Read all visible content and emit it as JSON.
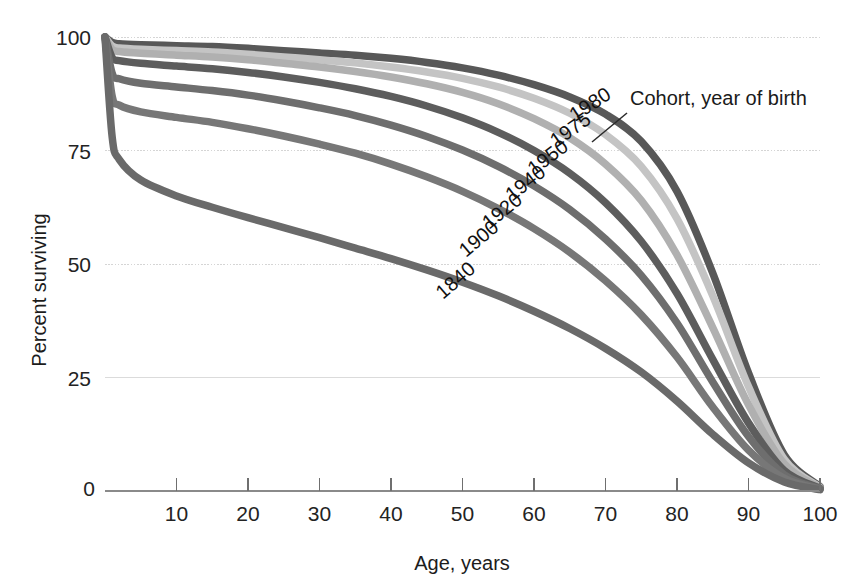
{
  "figure": {
    "background_color": "#ffffff",
    "plot_area": {
      "left": 105,
      "right": 820,
      "top": 37,
      "bottom": 491
    }
  },
  "axes": {
    "x": {
      "title": "Age, years",
      "ticks": [
        0,
        10,
        20,
        30,
        40,
        50,
        60,
        70,
        80,
        90,
        100
      ],
      "tick_labels": [
        "0",
        "10",
        "20",
        "30",
        "40",
        "50",
        "60",
        "70",
        "80",
        "90",
        "100"
      ],
      "range": [
        0,
        100
      ],
      "axis_color": "#8a8a8a"
    },
    "y": {
      "title": "Percent surviving",
      "ticks": [
        0,
        25,
        50,
        75,
        100
      ],
      "tick_labels": [
        "0",
        "25",
        "50",
        "75",
        "100"
      ],
      "range": [
        0,
        100
      ],
      "grid": true,
      "grid_color": "#d5d5d5"
    }
  },
  "annotation": {
    "text": "Cohort, year of birth",
    "x": 630,
    "y": 105,
    "leader_from": {
      "x": 627,
      "y": 113
    },
    "leader_to": {
      "x": 592,
      "y": 142
    }
  },
  "chart_data": {
    "type": "line",
    "title": "",
    "subtitle": "",
    "xlabel": "Age, years",
    "ylabel": "Percent surviving",
    "xlim": [
      0,
      100
    ],
    "ylim": [
      0,
      100
    ],
    "grid": true,
    "legend_position": "inline-curve-labels",
    "x": [
      0,
      1,
      2,
      5,
      10,
      15,
      20,
      25,
      30,
      35,
      40,
      45,
      50,
      55,
      60,
      65,
      70,
      75,
      80,
      85,
      90,
      95,
      100
    ],
    "series": [
      {
        "name": "1980",
        "label": "1980",
        "color": "#585858",
        "label_x": 575,
        "label_y": 122,
        "label_rotate": -33,
        "values": [
          100,
          98.8,
          98.5,
          98.3,
          98.1,
          97.9,
          97.5,
          97.0,
          96.5,
          96.0,
          95.3,
          94.4,
          93.2,
          91.6,
          89.5,
          86.8,
          83.0,
          77.0,
          66.0,
          48.0,
          26.0,
          8.0,
          1.0
        ]
      },
      {
        "name": "1975",
        "label": "1975",
        "color": "#c4c4c4",
        "label_x": 556,
        "label_y": 148,
        "label_rotate": -35,
        "values": [
          100,
          98.0,
          97.6,
          97.3,
          97.0,
          96.7,
          96.2,
          95.6,
          95.0,
          94.3,
          93.4,
          92.3,
          90.9,
          89.0,
          86.5,
          83.2,
          78.5,
          71.5,
          60.0,
          43.0,
          23.0,
          7.0,
          0.8
        ]
      },
      {
        "name": "1950",
        "label": "1950",
        "color": "#b0b0b0",
        "label_x": 534,
        "label_y": 176,
        "label_rotate": -37,
        "values": [
          100,
          97.3,
          96.8,
          96.4,
          96.0,
          95.6,
          95.0,
          94.2,
          93.4,
          92.4,
          91.2,
          89.7,
          87.8,
          85.3,
          82.0,
          77.8,
          72.0,
          64.0,
          52.0,
          36.0,
          19.0,
          6.0,
          0.7
        ]
      },
      {
        "name": "1940",
        "label": "1940",
        "color": "#5d5d5d",
        "label_x": 512,
        "label_y": 202,
        "label_rotate": -38,
        "values": [
          100,
          95.5,
          94.8,
          94.2,
          93.6,
          93.0,
          92.2,
          91.2,
          90.0,
          88.6,
          86.9,
          84.8,
          82.2,
          79.0,
          75.0,
          70.0,
          63.5,
          55.0,
          43.5,
          29.0,
          15.0,
          4.5,
          0.6
        ]
      },
      {
        "name": "1920",
        "label": "1920",
        "color": "#6e6e6e",
        "label_x": 489,
        "label_y": 230,
        "label_rotate": -39,
        "values": [
          100,
          92.0,
          90.8,
          89.8,
          89.0,
          88.2,
          87.2,
          85.9,
          84.4,
          82.7,
          80.6,
          78.1,
          75.1,
          71.5,
          67.2,
          62.0,
          55.5,
          47.5,
          37.0,
          24.0,
          12.0,
          3.6,
          0.5
        ]
      },
      {
        "name": "1900",
        "label": "1900",
        "color": "#777777",
        "label_x": 466,
        "label_y": 258,
        "label_rotate": -40,
        "values": [
          100,
          87.0,
          85.0,
          83.5,
          82.3,
          81.2,
          79.8,
          78.2,
          76.4,
          74.4,
          72.0,
          69.2,
          66.0,
          62.2,
          57.8,
          52.6,
          46.3,
          38.8,
          29.5,
          18.5,
          9.0,
          2.8,
          0.4
        ]
      },
      {
        "name": "1840",
        "label": "1840",
        "color": "#6a6a6a",
        "label_x": 443,
        "label_y": 300,
        "label_rotate": -41,
        "values": [
          100,
          78.0,
          73.0,
          68.5,
          65.0,
          62.5,
          60.2,
          58.0,
          55.8,
          53.5,
          51.2,
          48.7,
          46.0,
          43.0,
          39.6,
          35.8,
          31.4,
          26.2,
          19.8,
          12.5,
          6.2,
          2.0,
          0.3
        ]
      }
    ]
  }
}
